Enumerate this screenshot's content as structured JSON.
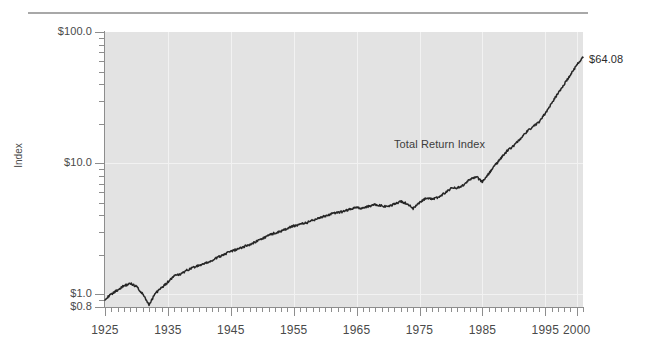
{
  "chart_data": {
    "type": "line",
    "title": "",
    "xlabel": "",
    "ylabel": "Index",
    "yscale": "log",
    "ylim": [
      0.8,
      100.0
    ],
    "xlim": [
      1925,
      2001
    ],
    "grid": true,
    "legend": "none",
    "y_tick_labels": [
      "$100.0",
      "$10.0",
      "$1.0",
      "$0.8"
    ],
    "y_tick_values": [
      100.0,
      10.0,
      1.0,
      0.8
    ],
    "x_tick_labels": [
      "1925",
      "1935",
      "1945",
      "1955",
      "1965",
      "1975",
      "1985",
      "1995",
      "2000"
    ],
    "x_tick_values": [
      1925,
      1935,
      1945,
      1955,
      1965,
      1975,
      1985,
      1995,
      2000
    ],
    "annotations": [
      {
        "text": "Total Return Index",
        "x": 1978,
        "y": 14.0
      },
      {
        "text": "$64.08",
        "x": 2001,
        "y": 64.08
      }
    ],
    "series": [
      {
        "name": "Total Return Index",
        "color": "#262626",
        "final_value": 64.08,
        "x": [
          1925,
          1926,
          1927,
          1928,
          1929,
          1930,
          1931,
          1932,
          1933,
          1934,
          1935,
          1936,
          1937,
          1938,
          1939,
          1940,
          1941,
          1942,
          1943,
          1944,
          1945,
          1946,
          1947,
          1948,
          1949,
          1950,
          1951,
          1952,
          1953,
          1954,
          1955,
          1956,
          1957,
          1958,
          1959,
          1960,
          1961,
          1962,
          1963,
          1964,
          1965,
          1966,
          1967,
          1968,
          1969,
          1970,
          1971,
          1972,
          1973,
          1974,
          1975,
          1976,
          1977,
          1978,
          1979,
          1980,
          1981,
          1982,
          1983,
          1984,
          1985,
          1986,
          1987,
          1988,
          1989,
          1990,
          1991,
          1992,
          1993,
          1994,
          1995,
          1996,
          1997,
          1998,
          1999,
          2000,
          2001
        ],
        "y": [
          0.92,
          1.0,
          1.08,
          1.16,
          1.21,
          1.15,
          1.0,
          0.83,
          1.02,
          1.12,
          1.24,
          1.38,
          1.42,
          1.52,
          1.6,
          1.66,
          1.72,
          1.8,
          1.92,
          2.02,
          2.12,
          2.2,
          2.3,
          2.4,
          2.52,
          2.66,
          2.8,
          2.94,
          3.02,
          3.18,
          3.32,
          3.42,
          3.5,
          3.66,
          3.82,
          3.94,
          4.1,
          4.18,
          4.3,
          4.45,
          4.6,
          4.52,
          4.7,
          4.85,
          4.72,
          4.62,
          4.88,
          5.1,
          4.92,
          4.5,
          5.0,
          5.4,
          5.32,
          5.5,
          5.9,
          6.4,
          6.5,
          6.8,
          7.5,
          7.9,
          7.2,
          8.3,
          9.6,
          11.0,
          12.5,
          13.6,
          15.3,
          17.2,
          19.0,
          20.4,
          24.0,
          28.5,
          34.0,
          40.0,
          47.0,
          56.0,
          64.08
        ]
      }
    ]
  }
}
